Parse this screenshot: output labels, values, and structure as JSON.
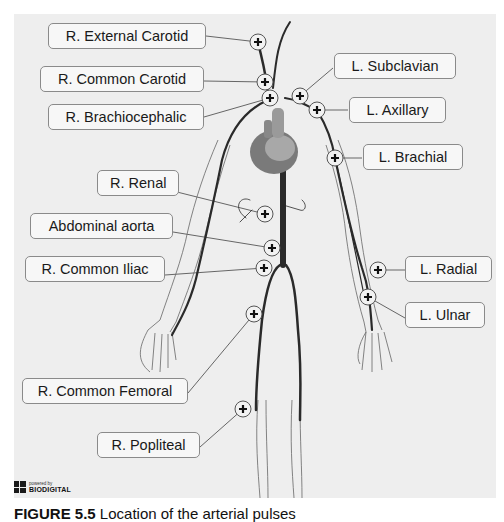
{
  "labels": {
    "r_external_carotid": "R. External Carotid",
    "r_common_carotid": "R. Common Carotid",
    "r_brachiocephalic": "R. Brachiocephalic",
    "l_subclavian": "L. Subclavian",
    "l_axillary": "L. Axillary",
    "l_brachial": "L. Brachial",
    "r_renal": "R. Renal",
    "abdominal_aorta": "Abdominal aorta",
    "r_common_iliac": "R. Common Iliac",
    "l_radial": "L. Radial",
    "l_ulnar": "L. Ulnar",
    "r_common_femoral": "R. Common Femoral",
    "r_popliteal": "R. Popliteal"
  },
  "logo": {
    "powered_by": "powered by",
    "brand": "BIODIGITAL"
  },
  "caption": {
    "figure": "FIGURE 5.5",
    "text": "Location of the arterial pulses"
  },
  "colors": {
    "panel": "#eeeeee",
    "artery": "#2a2a2a",
    "outline": "#555555",
    "label_border": "#8a8a8a"
  }
}
